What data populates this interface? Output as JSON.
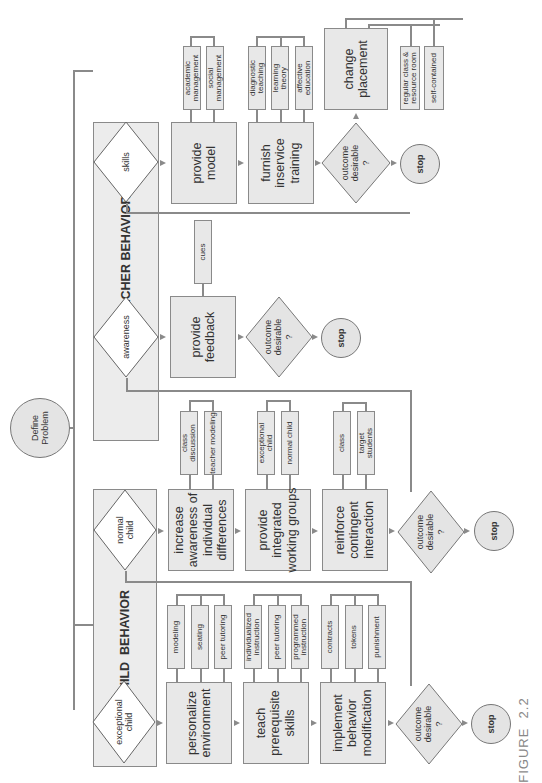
{
  "root": {
    "label": "Define\nProblem"
  },
  "teacher": {
    "lane_title": "TEACHER BEHAVIOR",
    "skills": {
      "decision": "skills",
      "steps": [
        {
          "label": "provide\nmodel",
          "options": [
            "academic\nmanagement",
            "social\nmanagement"
          ]
        },
        {
          "label": "furnish\ninservice\ntraining",
          "options": [
            "diagnostic\nteaching",
            "learning\ntheory",
            "affective\neducation"
          ]
        }
      ],
      "outcome": "outcome\ndesirable\n?",
      "stop": "stop",
      "alternative": {
        "label": "change\nplacement",
        "options": [
          "regular class &\nresource room",
          "self-contained"
        ]
      }
    },
    "awareness": {
      "decision": "awareness",
      "steps": [
        {
          "label": "provide\nfeedback",
          "options": [
            "cues"
          ]
        }
      ],
      "outcome": "outcome\ndesirable\n?",
      "stop": "stop"
    }
  },
  "child": {
    "lane_title": "CHILD  BEHAVIOR",
    "normal": {
      "decision": "normal\nchild",
      "steps": [
        {
          "label": "increase\nawareness of\nindividual\ndifferences",
          "options": [
            "class\ndiscussion",
            "teacher modeling"
          ]
        },
        {
          "label": "provide\nintegrated\nworking groups",
          "options": [
            "exceptional\nchild",
            "normal child"
          ]
        },
        {
          "label": "reinforce\ncontingent\ninteraction",
          "options": [
            "class",
            "target\nstudents"
          ]
        }
      ],
      "outcome": "outcome\ndesirable\n?",
      "stop": "stop"
    },
    "exceptional": {
      "decision": "exceptional\nchild",
      "steps": [
        {
          "label": "personalize\nenvironment",
          "options": [
            "modeling",
            "seating",
            "peer tutoring"
          ]
        },
        {
          "label": "teach\nprerequisite\nskills",
          "options": [
            "individualized\ninstruction",
            "peer tutoring",
            "programmed\ninstruction"
          ]
        },
        {
          "label": "implement\nbehavior\nmodification",
          "options": [
            "contracts",
            "tokens",
            "punishment"
          ]
        }
      ],
      "outcome": "outcome\ndesirable\n?",
      "stop": "stop"
    }
  },
  "caption": "FIGURE  2.2"
}
